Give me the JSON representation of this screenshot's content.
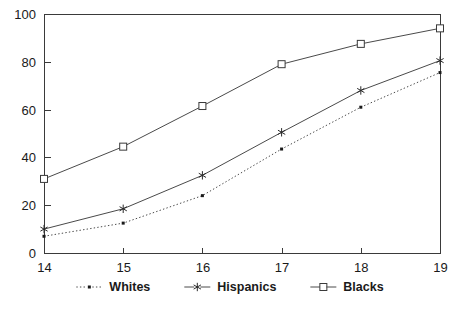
{
  "chart_data": {
    "type": "line",
    "title": "",
    "subtitle": "",
    "xlabel": "",
    "ylabel": "",
    "x": [
      14,
      15,
      16,
      17,
      18,
      19
    ],
    "xticklabels": [
      "14",
      "15",
      "16",
      "17",
      "18",
      "19"
    ],
    "yticklabels": [
      "0",
      "20",
      "40",
      "60",
      "80",
      "100"
    ],
    "yticks": [
      0,
      20,
      40,
      60,
      80,
      100
    ],
    "xlim": [
      14,
      19
    ],
    "ylim": [
      0,
      100
    ],
    "grid": false,
    "legend_position": "bottom",
    "series": [
      {
        "name": "Whites",
        "marker": "dot",
        "linestyle": "dotted",
        "color": "#4a4a4a",
        "values": [
          7,
          12.5,
          24,
          43.5,
          61,
          75.5
        ]
      },
      {
        "name": "Hispanics",
        "marker": "star",
        "linestyle": "solid",
        "color": "#4a4a4a",
        "values": [
          10,
          18.5,
          32.5,
          50.5,
          68,
          80.5
        ]
      },
      {
        "name": "Blacks",
        "marker": "square",
        "linestyle": "solid",
        "color": "#4a4a4a",
        "values": [
          31,
          44.5,
          61.5,
          79,
          87.5,
          94
        ]
      }
    ]
  },
  "axes": {
    "y_tick_labels": [
      "100",
      "80",
      "60",
      "40",
      "20",
      "0"
    ],
    "x_tick_labels": [
      "14",
      "15",
      "16",
      "17",
      "18",
      "19"
    ]
  },
  "legend": {
    "items": [
      {
        "label": "Whites",
        "marker": "dot-marker",
        "linestyle": "dotted"
      },
      {
        "label": "Hispanics",
        "marker": "asterisk-marker",
        "linestyle": "solid"
      },
      {
        "label": "Blacks",
        "marker": "square-marker",
        "linestyle": "solid"
      }
    ]
  }
}
